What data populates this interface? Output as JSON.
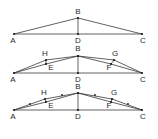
{
  "diagrams": [
    {
      "id": "stage-1",
      "points": {
        "A": [
          14,
          34
        ],
        "B": [
          78,
          18
        ],
        "C": [
          142,
          34
        ],
        "D": [
          78,
          34
        ]
      },
      "segments": [
        [
          "A",
          "B"
        ],
        [
          "B",
          "C"
        ],
        [
          "A",
          "C"
        ],
        [
          "B",
          "D"
        ]
      ],
      "labels": [
        {
          "text": "B",
          "x": 78,
          "y": 14
        },
        {
          "text": "A",
          "x": 13,
          "y": 43
        },
        {
          "text": "D",
          "x": 78,
          "y": 43
        },
        {
          "text": "C",
          "x": 143,
          "y": 43
        }
      ],
      "extra_dots": []
    },
    {
      "id": "stage-2",
      "points": {
        "A": [
          14,
          73
        ],
        "B": [
          78,
          56
        ],
        "C": [
          142,
          73
        ],
        "D": [
          78,
          73
        ],
        "H": [
          46,
          60
        ],
        "E": [
          46,
          64
        ],
        "G": [
          114,
          60
        ],
        "F": [
          111,
          64
        ]
      },
      "segments": [
        [
          "A",
          "H"
        ],
        [
          "H",
          "B"
        ],
        [
          "B",
          "G"
        ],
        [
          "G",
          "C"
        ],
        [
          "A",
          "E"
        ],
        [
          "E",
          "B"
        ],
        [
          "B",
          "F"
        ],
        [
          "F",
          "C"
        ],
        [
          "A",
          "C"
        ],
        [
          "B",
          "D"
        ],
        [
          "H",
          "E"
        ],
        [
          "G",
          "F"
        ]
      ],
      "labels": [
        {
          "text": "B",
          "x": 78,
          "y": 51
        },
        {
          "text": "H",
          "x": 45,
          "y": 56
        },
        {
          "text": "G",
          "x": 115,
          "y": 56
        },
        {
          "text": "E",
          "x": 51,
          "y": 70
        },
        {
          "text": "F",
          "x": 109,
          "y": 70
        },
        {
          "text": "A",
          "x": 13,
          "y": 82
        },
        {
          "text": "D",
          "x": 78,
          "y": 82
        },
        {
          "text": "C",
          "x": 143,
          "y": 82
        }
      ],
      "extra_dots": []
    },
    {
      "id": "stage-3",
      "points": {
        "A": [
          14,
          110
        ],
        "B": [
          78,
          93
        ],
        "C": [
          142,
          110
        ],
        "D": [
          78,
          110
        ],
        "H": [
          45,
          99
        ],
        "E": [
          46,
          102
        ],
        "G": [
          112,
          99
        ],
        "F": [
          111,
          102
        ]
      },
      "segments": [
        [
          "A",
          "H"
        ],
        [
          "H",
          "B"
        ],
        [
          "B",
          "G"
        ],
        [
          "G",
          "C"
        ],
        [
          "A",
          "E"
        ],
        [
          "E",
          "B"
        ],
        [
          "B",
          "F"
        ],
        [
          "F",
          "C"
        ],
        [
          "A",
          "C"
        ],
        [
          "B",
          "D"
        ],
        [
          "H",
          "E"
        ],
        [
          "G",
          "F"
        ]
      ],
      "labels": [
        {
          "text": "B",
          "x": 78,
          "y": 89
        },
        {
          "text": "H",
          "x": 44,
          "y": 95
        },
        {
          "text": "G",
          "x": 114,
          "y": 95
        },
        {
          "text": "E",
          "x": 51,
          "y": 108
        },
        {
          "text": "F",
          "x": 109,
          "y": 108
        },
        {
          "text": "A",
          "x": 13,
          "y": 119
        },
        {
          "text": "D",
          "x": 78,
          "y": 119
        },
        {
          "text": "C",
          "x": 143,
          "y": 119
        }
      ],
      "extra_dots": [
        [
          30,
          104
        ],
        [
          62,
          95
        ],
        [
          95,
          95
        ],
        [
          128,
          104
        ]
      ]
    }
  ]
}
